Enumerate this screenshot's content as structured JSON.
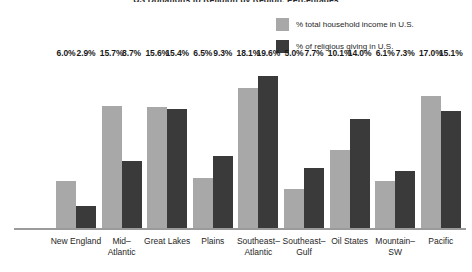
{
  "chart_data": {
    "type": "bar",
    "title": "US Donations to Religion by Region, Percentages",
    "xlabel": "",
    "ylabel": "",
    "ylim": [
      0,
      21
    ],
    "grid": false,
    "legend_position": "top-right",
    "categories": [
      "New England",
      "Mid–Atlantic",
      "Great Lakes",
      "Plains",
      "Southeast–Atlantic",
      "Southeast–Gulf",
      "Oil States",
      "Mountain–SW",
      "Pacific"
    ],
    "series": [
      {
        "name": "% total household income in U.S.",
        "color": "#a8a8a8",
        "values": [
          6.0,
          15.7,
          15.6,
          6.5,
          18.1,
          5.0,
          10.1,
          6.1,
          17.0
        ],
        "labels": [
          "6.0%",
          "15.7%",
          "15.6%",
          "6.5%",
          "18.1%",
          "5.0%",
          "10.1%",
          "6.1%",
          "17.0%"
        ]
      },
      {
        "name": "% of religious giving in U.S.",
        "color": "#3a3a3a",
        "values": [
          2.9,
          8.7,
          15.4,
          9.3,
          19.6,
          7.7,
          14.0,
          7.3,
          15.1
        ],
        "labels": [
          "2.9%",
          "8.7%",
          "15.4%",
          "9.3%",
          "19.6%",
          "7.7%",
          "14.0%",
          "7.3%",
          "15.1%"
        ]
      }
    ]
  },
  "legend": {
    "items": [
      {
        "label": "% total household income in U.S.",
        "color": "#a8a8a8"
      },
      {
        "label": "% of religious giving in U.S.",
        "color": "#3a3a3a"
      }
    ]
  },
  "colors": {
    "series_light": "#a8a8a8",
    "series_dark": "#3a3a3a",
    "axis": "#9b9b9b",
    "text": "#1a1a1a",
    "background": "#ffffff"
  }
}
